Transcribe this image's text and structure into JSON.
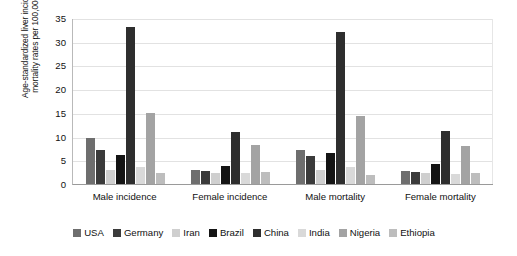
{
  "chart_data": {
    "type": "bar",
    "title": "",
    "subtitle": "",
    "xlabel": "",
    "ylabel": "Age-standardized liver incidence and\nmortality rates per 100,000 people",
    "ylim": [
      0,
      35
    ],
    "ytick_step": 5,
    "yticks": [
      "35",
      "30",
      "25",
      "20",
      "15",
      "10",
      "5",
      "0"
    ],
    "grid": true,
    "legend_position": "bottom",
    "categories": [
      "Male incidence",
      "Female incidence",
      "Male mortality",
      "Female mortality"
    ],
    "series": [
      {
        "name": "USA",
        "color": "#6e6e6e",
        "values": [
          9.8,
          3.0,
          7.2,
          2.8
        ]
      },
      {
        "name": "Germany",
        "color": "#3b3b3b",
        "values": [
          7.1,
          2.8,
          6.0,
          2.6
        ]
      },
      {
        "name": "Iran",
        "color": "#cfcfcf",
        "values": [
          3.0,
          2.3,
          2.9,
          2.3
        ]
      },
      {
        "name": "Brazil",
        "color": "#141414",
        "values": [
          6.2,
          3.8,
          6.5,
          4.2
        ]
      },
      {
        "name": "China",
        "color": "#2e2e2e",
        "values": [
          33.1,
          11.0,
          32.0,
          11.1
        ]
      },
      {
        "name": "India",
        "color": "#d9d9d9",
        "values": [
          3.5,
          2.3,
          3.5,
          2.2
        ]
      },
      {
        "name": "Nigeria",
        "color": "#a3a3a3",
        "values": [
          14.9,
          8.2,
          14.4,
          8.0
        ]
      },
      {
        "name": "Ethiopia",
        "color": "#bdbdbd",
        "values": [
          2.4,
          2.5,
          2.0,
          2.3
        ]
      }
    ]
  },
  "legend": {
    "items": [
      {
        "label": "USA"
      },
      {
        "label": "Germany"
      },
      {
        "label": "Iran"
      },
      {
        "label": "Brazil"
      },
      {
        "label": "China"
      },
      {
        "label": "India"
      },
      {
        "label": "Nigeria"
      },
      {
        "label": "Ethiopia"
      }
    ]
  }
}
